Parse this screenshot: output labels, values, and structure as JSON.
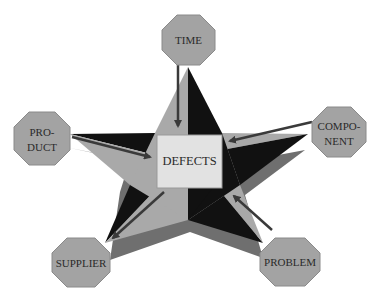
{
  "diagram": {
    "type": "star-relationship-diagram",
    "center": {
      "label": "DEFECTS"
    },
    "nodes": [
      {
        "id": "time",
        "lines": [
          "TIME"
        ],
        "arrow_direction": "to-center"
      },
      {
        "id": "component",
        "lines": [
          "COMPO-",
          "NENT"
        ],
        "arrow_direction": "to-center"
      },
      {
        "id": "problem",
        "lines": [
          "PROBLEM"
        ],
        "arrow_direction": "to-center"
      },
      {
        "id": "supplier",
        "lines": [
          "SUPPLIER"
        ],
        "arrow_direction": "from-center"
      },
      {
        "id": "product",
        "lines": [
          "PRO-",
          "DUCT"
        ],
        "arrow_direction": "to-center"
      }
    ],
    "colors": {
      "star_light": "#a9a9a9",
      "star_dark": "#111111",
      "star_shadow": "#6f6f6f",
      "center_box": "#e2e2e2",
      "octagon_fill": "#a3a3a3",
      "octagon_stroke": "#8a8a8a",
      "arrow": "#3a3a3a"
    }
  }
}
